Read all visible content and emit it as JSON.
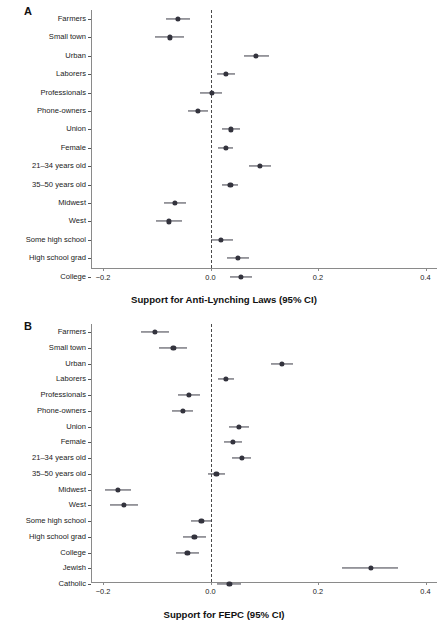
{
  "figure": {
    "background": "#ffffff",
    "point_color": "#33333d",
    "line_color": "#3b3b46",
    "axis_color": "#8a8a8a",
    "zero_line_color": "#4a4a4a"
  },
  "panels": [
    {
      "letter": "A",
      "axis_title": "Support for Anti-Lynching Laws (95% CI)",
      "xticks": [
        "-0.2",
        "0.0",
        "0.2",
        "0.4"
      ]
    },
    {
      "letter": "B",
      "axis_title": "Support for FEPC (95% CI)",
      "xticks": [
        "-0.2",
        "0.0",
        "0.2",
        "0.4"
      ]
    }
  ],
  "chart_data": [
    {
      "type": "scatter",
      "title": "A",
      "xlabel": "Support for Anti-Lynching Laws (95% CI)",
      "ylabel": "",
      "xlim": [
        -0.26,
        0.44
      ],
      "xticks": [
        -0.2,
        0.0,
        0.2,
        0.4
      ],
      "grid": false,
      "legend": "none",
      "reference_line": 0.0,
      "categories": [
        "Farmers",
        "Small town",
        "Urban",
        "Laborers",
        "Professionals",
        "Phone-owners",
        "Union",
        "Female",
        "21–34 years old",
        "35–50 years old",
        "Midwest",
        "West",
        "Some high school",
        "High school grad",
        "College"
      ],
      "estimates": [
        -0.061,
        -0.076,
        0.085,
        0.029,
        0.002,
        -0.023,
        0.038,
        0.028,
        0.092,
        0.037,
        -0.066,
        -0.077,
        0.02,
        0.051,
        0.057
      ],
      "ci_low": [
        -0.083,
        -0.104,
        0.062,
        0.013,
        -0.019,
        -0.041,
        0.021,
        0.014,
        0.072,
        0.022,
        -0.087,
        -0.101,
        0.0,
        0.03,
        0.036
      ],
      "ci_high": [
        -0.039,
        -0.05,
        0.108,
        0.046,
        0.022,
        -0.004,
        0.055,
        0.042,
        0.112,
        0.052,
        -0.046,
        -0.053,
        0.041,
        0.072,
        0.078
      ]
    },
    {
      "type": "scatter",
      "title": "B",
      "xlabel": "Support for FEPC (95% CI)",
      "ylabel": "",
      "xlim": [
        -0.26,
        0.44
      ],
      "xticks": [
        -0.2,
        0.0,
        0.2,
        0.4
      ],
      "grid": false,
      "legend": "none",
      "reference_line": 0.0,
      "categories": [
        "Farmers",
        "Small town",
        "Urban",
        "Laborers",
        "Professionals",
        "Phone-owners",
        "Union",
        "Female",
        "21–34 years old",
        "35–50 years old",
        "Midwest",
        "West",
        "Some high school",
        "High school grad",
        "College",
        "Jewish",
        "Catholic"
      ],
      "estimates": [
        -0.104,
        -0.069,
        0.133,
        0.029,
        -0.04,
        -0.052,
        0.053,
        0.042,
        0.058,
        0.011,
        -0.172,
        -0.161,
        -0.017,
        -0.03,
        -0.043,
        0.299,
        0.035
      ],
      "ci_low": [
        -0.13,
        -0.095,
        0.112,
        0.014,
        -0.06,
        -0.072,
        0.034,
        0.026,
        0.04,
        -0.005,
        -0.196,
        -0.187,
        -0.037,
        -0.051,
        -0.064,
        0.245,
        0.013
      ],
      "ci_high": [
        -0.078,
        -0.043,
        0.154,
        0.044,
        -0.02,
        -0.032,
        0.072,
        0.058,
        0.076,
        0.027,
        -0.148,
        -0.135,
        0.003,
        -0.009,
        -0.022,
        0.348,
        0.057
      ]
    }
  ]
}
